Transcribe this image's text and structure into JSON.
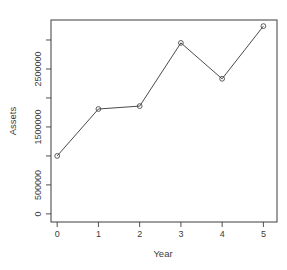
{
  "chart_data": {
    "type": "line",
    "title": "",
    "xlabel": "Year",
    "ylabel": "Assets",
    "x": [
      0,
      1,
      2,
      3,
      4,
      5
    ],
    "series": [
      {
        "name": "Assets",
        "marker": "open-circle",
        "color": "#4a4a4a",
        "values": [
          1000000,
          1810000,
          1860000,
          2950000,
          2330000,
          3240000
        ]
      }
    ],
    "x_ticks": [
      0,
      1,
      2,
      3,
      4,
      5
    ],
    "x_tick_labels": [
      "0",
      "1",
      "2",
      "3",
      "4",
      "5"
    ],
    "y_ticks": [
      0,
      500000,
      1000000,
      1500000,
      2000000,
      2500000,
      3000000
    ],
    "y_tick_labels": [
      "0",
      "500000",
      "",
      "1500000",
      "",
      "2500000",
      ""
    ],
    "xlim": [
      -0.15,
      5.33
    ],
    "ylim": [
      -140000,
      3345000
    ],
    "grid": false,
    "legend": "none",
    "style": "r-base-plot"
  },
  "colors": {
    "axis": "#3c3c3c",
    "line": "#4a4a4a",
    "background": "#ffffff"
  }
}
